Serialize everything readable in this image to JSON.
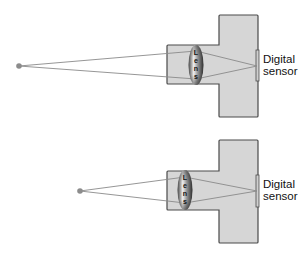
{
  "diagram": {
    "title": "",
    "panels": [
      {
        "id": "far-object",
        "lens_label": "Lens",
        "sensor_label_line1": "Digital",
        "sensor_label_line2": "sensor"
      },
      {
        "id": "near-object",
        "lens_label": "Lens",
        "sensor_label_line1": "Digital",
        "sensor_label_line2": "sensor"
      }
    ],
    "colors": {
      "body_fill": "#d6d6d6",
      "body_stroke": "#4a4a4a",
      "ray": "#8a8a8a",
      "object_point": "#8c8c8c",
      "lens_dark": "#3a3a3a",
      "lens_light": "#e8e8e8"
    }
  }
}
